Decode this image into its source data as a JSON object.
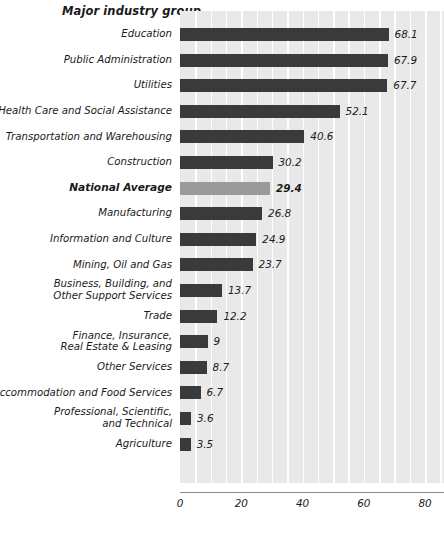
{
  "chart_data": {
    "type": "bar",
    "orientation": "horizontal",
    "title": "Major industry group",
    "xlabel": "",
    "ylabel": "Major industry group",
    "xlim": [
      0,
      80
    ],
    "xticks": [
      0,
      20,
      40,
      60,
      80
    ],
    "grid": true,
    "legend": null,
    "highlight_category": "National Average",
    "categories": [
      "Education",
      "Public Administration",
      "Utilities",
      "Health Care and Social Assistance",
      "Transportation and Warehousing",
      "Construction",
      "National Average",
      "Manufacturing",
      "Information and Culture",
      "Mining, Oil and Gas",
      "Business, Building, and\nOther Support Services",
      "Trade",
      "Finance, Insurance,\nReal Estate & Leasing",
      "Other Services",
      "Accommodation and Food Services",
      "Professional, Scientific,\nand Technical",
      "Agriculture"
    ],
    "values": [
      68.1,
      67.9,
      67.7,
      52.1,
      40.6,
      30.2,
      29.4,
      26.8,
      24.9,
      23.7,
      13.7,
      12.2,
      9,
      8.7,
      6.7,
      3.6,
      3.5
    ],
    "value_labels": [
      "68.1",
      "67.9",
      "67.7",
      "52.1",
      "40.6",
      "30.2",
      "29.4",
      "26.8",
      "24.9",
      "23.7",
      "13.7",
      "12.2",
      "9",
      "8.7",
      "6.7",
      "3.6",
      "3.5"
    ],
    "colors": {
      "bar": "#3a3a3a",
      "highlight_bar": "#9a9a9a",
      "plot_background": "#e9e9e9",
      "gridline": "#ffffff",
      "axis": "#8a8a8a",
      "text": "#1a1a1a",
      "page_background": "#ffffff"
    }
  },
  "axis": {
    "tick_labels": [
      "0",
      "20",
      "40",
      "60",
      "80"
    ]
  }
}
